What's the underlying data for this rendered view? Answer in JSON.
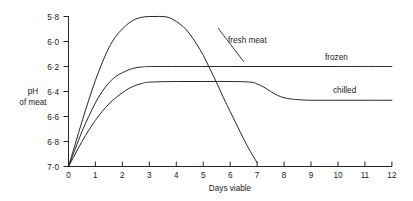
{
  "chart_data": {
    "type": "line",
    "title": "",
    "xlabel": "Days viable",
    "ylabel": "pH of meat",
    "ylabel_line1": "pH",
    "ylabel_line2": "of meat",
    "xlim": [
      0,
      12
    ],
    "ylim": [
      5.8,
      7.0
    ],
    "y_inverted": true,
    "grid": false,
    "legend_position": "inline-annotations",
    "xticks": [
      "0",
      "1",
      "2",
      "3",
      "4",
      "5",
      "6",
      "7",
      "8",
      "9",
      "10",
      "11",
      "12"
    ],
    "xtick_values": [
      0,
      1,
      2,
      3,
      4,
      5,
      6,
      7,
      8,
      9,
      10,
      11,
      12
    ],
    "yticks": [
      "5·8",
      "6·0",
      "6·2",
      "6·4",
      "6·6",
      "6·8",
      "7·0"
    ],
    "ytick_values": [
      5.8,
      6.0,
      6.2,
      6.4,
      6.6,
      6.8,
      7.0
    ],
    "series": [
      {
        "name": "fresh meat",
        "label": "fresh meat",
        "color": "#262626",
        "points": [
          [
            0.0,
            7.0
          ],
          [
            0.25,
            6.82
          ],
          [
            0.5,
            6.64
          ],
          [
            0.75,
            6.47
          ],
          [
            1.0,
            6.31
          ],
          [
            1.25,
            6.17
          ],
          [
            1.5,
            6.05
          ],
          [
            1.75,
            5.96
          ],
          [
            2.0,
            5.9
          ],
          [
            2.25,
            5.85
          ],
          [
            2.5,
            5.82
          ],
          [
            2.75,
            5.805
          ],
          [
            3.0,
            5.8
          ],
          [
            3.25,
            5.8
          ],
          [
            3.5,
            5.8
          ],
          [
            3.75,
            5.81
          ],
          [
            4.0,
            5.84
          ],
          [
            4.25,
            5.88
          ],
          [
            4.5,
            5.94
          ],
          [
            4.75,
            6.02
          ],
          [
            5.0,
            6.11
          ],
          [
            5.25,
            6.22
          ],
          [
            5.5,
            6.33
          ],
          [
            5.75,
            6.45
          ],
          [
            6.0,
            6.56
          ],
          [
            6.25,
            6.67
          ],
          [
            6.5,
            6.78
          ],
          [
            6.75,
            6.88
          ],
          [
            7.0,
            6.97
          ],
          [
            7.2,
            7.04
          ],
          [
            7.5,
            7.14
          ],
          [
            7.75,
            7.22
          ],
          [
            8.0,
            7.3
          ]
        ]
      },
      {
        "name": "frozen",
        "label": "frozen",
        "color": "#262626",
        "points": [
          [
            0.0,
            7.0
          ],
          [
            0.25,
            6.86
          ],
          [
            0.5,
            6.72
          ],
          [
            0.75,
            6.6
          ],
          [
            1.0,
            6.49
          ],
          [
            1.25,
            6.4
          ],
          [
            1.5,
            6.33
          ],
          [
            1.75,
            6.28
          ],
          [
            2.0,
            6.25
          ],
          [
            2.25,
            6.225
          ],
          [
            2.5,
            6.21
          ],
          [
            2.75,
            6.203
          ],
          [
            3.0,
            6.2
          ],
          [
            4.0,
            6.2
          ],
          [
            6.0,
            6.2
          ],
          [
            8.0,
            6.2
          ],
          [
            10.0,
            6.2
          ],
          [
            12.0,
            6.2
          ]
        ]
      },
      {
        "name": "chilled",
        "label": "chilled",
        "color": "#262626",
        "points": [
          [
            0.0,
            7.0
          ],
          [
            0.25,
            6.9
          ],
          [
            0.5,
            6.8
          ],
          [
            0.75,
            6.71
          ],
          [
            1.0,
            6.63
          ],
          [
            1.25,
            6.56
          ],
          [
            1.5,
            6.5
          ],
          [
            1.75,
            6.45
          ],
          [
            2.0,
            6.41
          ],
          [
            2.25,
            6.375
          ],
          [
            2.5,
            6.35
          ],
          [
            2.75,
            6.335
          ],
          [
            3.0,
            6.325
          ],
          [
            4.0,
            6.32
          ],
          [
            5.0,
            6.32
          ],
          [
            6.0,
            6.32
          ],
          [
            6.75,
            6.325
          ],
          [
            7.0,
            6.34
          ],
          [
            7.25,
            6.365
          ],
          [
            7.5,
            6.4
          ],
          [
            7.75,
            6.43
          ],
          [
            8.0,
            6.45
          ],
          [
            8.25,
            6.46
          ],
          [
            8.5,
            6.465
          ],
          [
            9.0,
            6.47
          ],
          [
            10.0,
            6.47
          ],
          [
            11.0,
            6.47
          ],
          [
            12.0,
            6.47
          ]
        ]
      }
    ],
    "annotations": [
      {
        "text": "fresh meat",
        "x": 5.6,
        "y": 6.02,
        "leader": true
      },
      {
        "text": "frozen",
        "x": 9.6,
        "y": 6.11,
        "leader": false
      },
      {
        "text": "chilled",
        "x": 9.9,
        "y": 6.38,
        "leader": false
      }
    ]
  }
}
